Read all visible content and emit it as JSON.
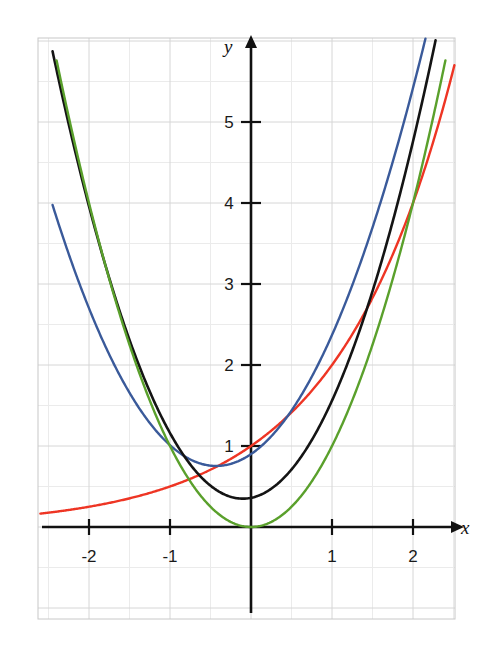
{
  "chart_data": {
    "type": "line",
    "title": "",
    "xlabel": "x",
    "ylabel": "y",
    "xlim": [
      -2.62,
      2.85
    ],
    "ylim": [
      -0.62,
      5.72
    ],
    "grid": true,
    "grid_step": 0.5,
    "legend": "none",
    "x_ticks": [
      -2,
      -1,
      1,
      2
    ],
    "y_ticks": [
      1,
      2,
      3,
      4,
      5
    ],
    "x_tick_labels": [
      "-2",
      "-1",
      "1",
      "2"
    ],
    "y_tick_labels": [
      "1",
      "2",
      "3",
      "4",
      "5"
    ],
    "common_point": [
      2,
      4
    ],
    "series": [
      {
        "name": "red-exponential",
        "color": "#ee3524",
        "formula": "y = 2^x",
        "x": [
          -2.6,
          -2.4,
          -2.2,
          -2.0,
          -1.8,
          -1.6,
          -1.4,
          -1.2,
          -1.0,
          -0.8,
          -0.6,
          -0.4,
          -0.2,
          0.0,
          0.2,
          0.4,
          0.6,
          0.8,
          1.0,
          1.2,
          1.4,
          1.6,
          1.8,
          2.0,
          2.2,
          2.4,
          2.55
        ],
        "values": [
          0.165,
          0.189,
          0.218,
          0.25,
          0.287,
          0.33,
          0.379,
          0.435,
          0.5,
          0.574,
          0.66,
          0.758,
          0.871,
          1.0,
          1.149,
          1.32,
          1.516,
          1.741,
          2.0,
          2.297,
          2.639,
          3.031,
          3.482,
          4.0,
          4.595,
          5.278,
          5.86
        ]
      },
      {
        "name": "blue-parabola",
        "color": "#3a5a9a",
        "formula": "y = 0.75x^2 + 0.65x + 0.9",
        "x": [
          -2.45,
          -2.2,
          -2.0,
          -1.8,
          -1.6,
          -1.4,
          -1.2,
          -1.0,
          -0.8,
          -0.6,
          -0.45,
          -0.2,
          0.0,
          0.25,
          0.5,
          0.75,
          1.0,
          1.25,
          1.5,
          1.75,
          2.0,
          2.2,
          2.4,
          2.5
        ],
        "values": [
          2.16,
          1.11,
          0.98,
          0.91,
          0.76,
          0.68,
          0.62,
          0.6,
          0.61,
          0.64,
          0.76,
          0.8,
          0.9,
          1.11,
          1.41,
          1.8,
          2.3,
          2.89,
          3.56,
          4.33,
          4.0,
          5.21,
          6.0,
          6.4
        ]
      },
      {
        "name": "black-parabola",
        "color": "#141414",
        "formula": "y = x^2 + 0.2x + 0.36",
        "x": [
          -2.45,
          -2.2,
          -2.0,
          -1.8,
          -1.6,
          -1.4,
          -1.2,
          -1.0,
          -0.8,
          -0.6,
          -0.4,
          -0.2,
          -0.1,
          0.0,
          0.25,
          0.5,
          0.75,
          1.0,
          1.25,
          1.5,
          1.75,
          2.0,
          2.2,
          2.4
        ],
        "values": [
          4.22,
          4.05,
          3.6,
          3.2,
          2.82,
          2.46,
          2.12,
          1.8,
          1.5,
          1.22,
          0.96,
          0.72,
          0.66,
          0.6,
          0.5,
          0.55,
          0.78,
          1.35,
          1.95,
          2.7,
          3.3,
          4.0,
          4.9,
          5.9
        ]
      },
      {
        "name": "green-quadratic",
        "color": "#5aa02c",
        "formula": "y = x^2",
        "x": [
          -2.4,
          -2.2,
          -2.0,
          -1.8,
          -1.6,
          -1.4,
          -1.2,
          -1.0,
          -0.8,
          -0.6,
          -0.4,
          -0.2,
          0.0,
          0.2,
          0.4,
          0.6,
          0.8,
          1.0,
          1.2,
          1.4,
          1.6,
          1.8,
          2.0,
          2.2,
          2.4
        ],
        "values": [
          5.76,
          4.84,
          4.0,
          3.24,
          2.56,
          1.96,
          1.44,
          1.0,
          0.64,
          0.36,
          0.16,
          0.04,
          0.0,
          0.04,
          0.16,
          0.36,
          0.64,
          1.0,
          1.44,
          1.96,
          2.56,
          3.24,
          4.0,
          4.84,
          5.76
        ]
      }
    ]
  },
  "axes": {
    "x_axis_name": "x",
    "y_axis_name": "y"
  },
  "colors": {
    "grid_major": "#d6d6d6",
    "grid_minor": "#ebebeb",
    "axis": "#111111",
    "red": "#ee3524",
    "blue": "#3a5a9a",
    "black": "#141414",
    "green": "#5aa02c"
  }
}
